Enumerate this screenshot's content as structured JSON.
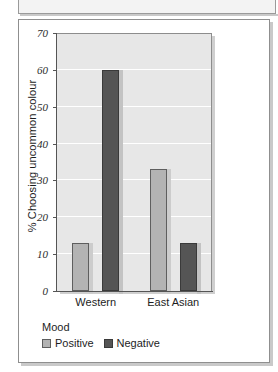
{
  "chart_data": {
    "type": "bar",
    "title": "",
    "xlabel": "",
    "ylabel": "% Choosing uncommon colour",
    "categories": [
      "Western",
      "East Asian"
    ],
    "series": [
      {
        "name": "Positive",
        "values": [
          13,
          33
        ],
        "color": "#b3b3b3"
      },
      {
        "name": "Negative",
        "values": [
          60,
          13
        ],
        "color": "#555555"
      }
    ],
    "ylim": [
      0,
      70
    ],
    "ytick_step": 10,
    "yticks": [
      70,
      60,
      50,
      40,
      30,
      20,
      10,
      0
    ],
    "grid": true,
    "grid_color": "#ffffff",
    "plot_background": "#e7e7e7",
    "legend": {
      "title": "Mood",
      "position": "below-axis-left",
      "entries": [
        "Positive",
        "Negative"
      ]
    }
  },
  "axis": {
    "y": {
      "label": "% Choosing uncommon colour",
      "ticks": [
        "70",
        "60",
        "50",
        "40",
        "30",
        "20",
        "10",
        "0"
      ]
    },
    "x": {
      "ticks": [
        "Western",
        "East Asian"
      ]
    }
  },
  "legend": {
    "title": "Mood",
    "items": [
      {
        "label": "Positive",
        "color": "#b3b3b3"
      },
      {
        "label": "Negative",
        "color": "#555555"
      }
    ]
  }
}
